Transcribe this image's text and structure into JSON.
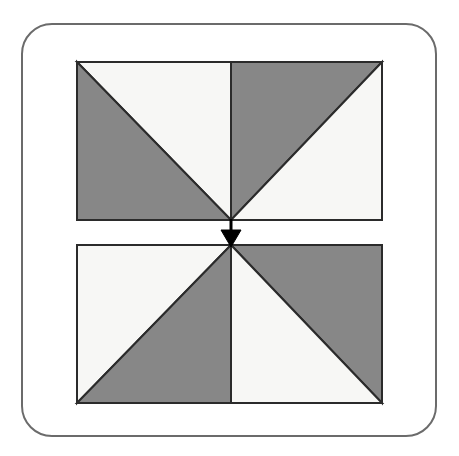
{
  "figure": {
    "canvas": {
      "width": 459,
      "height": 456,
      "background": "#ffffff"
    },
    "frame": {
      "name": "rounded-border",
      "x": 22,
      "y": 24,
      "width": 414,
      "height": 412,
      "radius": 30,
      "stroke": "#6b6b6b",
      "stroke_width": 2,
      "fill": "#ffffff"
    },
    "colors": {
      "dark": "#878787",
      "light": "#f7f7f5",
      "outline": "#2b2b2b",
      "arrow": "#000000",
      "frame_stroke": "#6b6b6b",
      "background": "#ffffff"
    },
    "shapes": {
      "top_rectangle": {
        "label": "upper pinwheel rectangle",
        "x": 77,
        "y": 62,
        "width": 305,
        "height": 158,
        "center_x": 231,
        "center_y": 220,
        "triangles": [
          {
            "name": "top-left-upper",
            "fill": "light",
            "points": "77,62 231,62 231,220"
          },
          {
            "name": "top-left-lower",
            "fill": "dark",
            "points": "77,62 231,220 77,220"
          },
          {
            "name": "top-right-upper",
            "fill": "dark",
            "points": "231,62 382,62 231,220"
          },
          {
            "name": "top-right-lower",
            "fill": "light",
            "points": "382,62 382,220 231,220"
          }
        ]
      },
      "bottom_rectangle": {
        "label": "lower pinwheel rectangle",
        "x": 77,
        "y": 245,
        "width": 305,
        "height": 158,
        "center_x": 231,
        "center_y": 245,
        "triangles": [
          {
            "name": "bottom-left-upper",
            "fill": "light",
            "points": "77,245 231,245 77,403"
          },
          {
            "name": "bottom-left-lower",
            "fill": "dark",
            "points": "231,245 231,403 77,403"
          },
          {
            "name": "bottom-right-upper",
            "fill": "dark",
            "points": "231,245 382,245 382,403"
          },
          {
            "name": "bottom-right-lower",
            "fill": "light",
            "points": "231,245 382,403 231,403"
          }
        ]
      },
      "arrow": {
        "label": "downward arrow",
        "direction": "down",
        "shaft_x": 231,
        "shaft_top_y": 220,
        "shaft_bottom_y": 234,
        "shaft_width": 3,
        "head_points": "221,231 241,231 231,246",
        "tip_x": 231,
        "tip_y": 246
      }
    },
    "gap": {
      "label": "gap between rectangles",
      "top_y": 220,
      "bottom_y": 245,
      "height": 25
    }
  }
}
